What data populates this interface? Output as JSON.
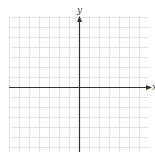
{
  "graph": {
    "type": "coordinate-grid",
    "x_axis_label": "x",
    "y_axis_label": "y",
    "grid": {
      "left": 9,
      "right": 148,
      "top": 15,
      "bottom": 152,
      "spacing": 10,
      "color": "#e2e2e2"
    },
    "origin": {
      "x": 79,
      "y": 87
    },
    "axis_color": "#333333"
  }
}
